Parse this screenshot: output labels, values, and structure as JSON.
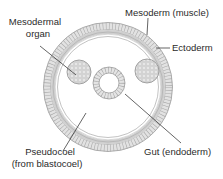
{
  "diagram": {
    "labels": {
      "mesodermal_organ_line1": "Mesodermal",
      "mesodermal_organ_line2": "organ",
      "mesoderm": "Mesoderm (muscle)",
      "ectoderm": "Ectoderm",
      "gut": "Gut (endoderm)",
      "pseudocoel_line1": "Pseudocoel",
      "pseudocoel_line2": "(from blastocoel)"
    },
    "colors": {
      "cell_fill": "#e4e4e4",
      "cell_stroke": "#9a9a9a",
      "mesoderm_band": "#c8c8c8",
      "leader_line": "#222222",
      "text": "#2a2a2a"
    }
  }
}
